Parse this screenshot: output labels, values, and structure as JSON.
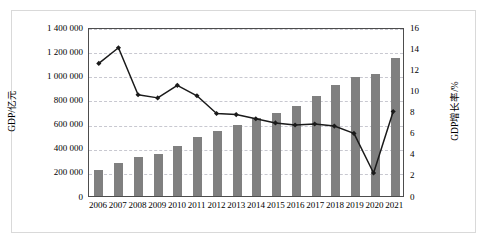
{
  "chart_data": {
    "type": "bar",
    "title": "",
    "subtitle": "",
    "xlabel": "",
    "ylabel": "GDP/亿元",
    "y2label": "GDP增长率/%",
    "grid": true,
    "legend": "none",
    "categories": [
      "2006",
      "2007",
      "2008",
      "2009",
      "2010",
      "2011",
      "2012",
      "2013",
      "2014",
      "2015",
      "2016",
      "2017",
      "2018",
      "2019",
      "2020",
      "2021"
    ],
    "ylim": [
      0,
      1400000
    ],
    "yticks": [
      0,
      200000,
      400000,
      600000,
      800000,
      1000000,
      1200000,
      1400000
    ],
    "ytick_labels": [
      "0",
      "200 000",
      "400 000",
      "600 000",
      "800 000",
      "1 000 000",
      "1 200 000",
      "1 400 000"
    ],
    "y2lim": [
      0,
      16
    ],
    "y2ticks": [
      0,
      2,
      4,
      6,
      8,
      10,
      12,
      14,
      16
    ],
    "y2tick_labels": [
      "0",
      "2",
      "4",
      "6",
      "8",
      "10",
      "12",
      "14",
      "16"
    ],
    "series": [
      {
        "name": "GDP/亿元",
        "type": "bar",
        "axis": "left",
        "color": "#808080",
        "values": [
          219000,
          270000,
          320000,
          348000,
          412000,
          487000,
          539000,
          592000,
          644000,
          686000,
          746000,
          832000,
          920000,
          986000,
          1013000,
          1143000
        ]
      },
      {
        "name": "GDP增长率/%",
        "type": "line",
        "axis": "right",
        "color": "#1a1a1a",
        "marker": "diamond",
        "values": [
          12.7,
          14.2,
          9.7,
          9.4,
          10.6,
          9.6,
          7.9,
          7.8,
          7.4,
          7.0,
          6.8,
          6.9,
          6.7,
          6.0,
          2.2,
          8.1
        ]
      }
    ]
  }
}
